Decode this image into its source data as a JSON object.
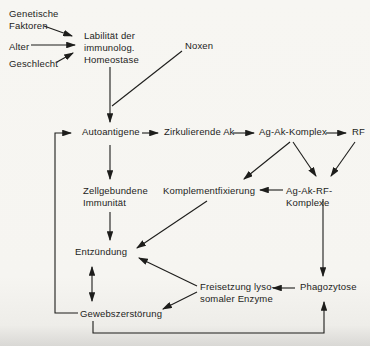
{
  "figure": {
    "language": "de",
    "type": "flowchart"
  },
  "colors": {
    "paper": "#f6f5f1",
    "ink": "#1d1d1b"
  },
  "nodes": {
    "genetische_faktoren": {
      "label": "Genetische\nFaktoren"
    },
    "alter": {
      "label": "Alter"
    },
    "geschlecht": {
      "label": "Geschlecht"
    },
    "labilitaet": {
      "label": "Labilität der\nimmunolog.\nHomeostase"
    },
    "noxen": {
      "label": "Noxen"
    },
    "autoantigene": {
      "label": "Autoantigene"
    },
    "zirkulierende_ak": {
      "label": "Zirkulierende Ak"
    },
    "ag_ak_komplex": {
      "label": "Ag-Ak-Komplex"
    },
    "rf": {
      "label": "RF"
    },
    "zellgebundene_immunitaet": {
      "label": "Zellgebundene\nImmunität"
    },
    "komplementfixierung": {
      "label": "Komplementfixierung"
    },
    "ag_ak_rf_komplexe": {
      "label": "Ag-Ak-RF-Komplexe"
    },
    "entzuendung": {
      "label": "Entzündung"
    },
    "freisetzung_lysosomaler_enzyme": {
      "label": "Freisetzung lyso-\nsomaler Enzyme"
    },
    "phagozytose": {
      "label": "Phagozytose"
    },
    "gewebszerstoerung": {
      "label": "Gewebszerstörung"
    }
  },
  "edges": [
    {
      "from": "genetische_faktoren",
      "to": "labilitaet"
    },
    {
      "from": "alter",
      "to": "labilitaet"
    },
    {
      "from": "geschlecht",
      "to": "labilitaet"
    },
    {
      "from": "noxen",
      "to": "autoantigene"
    },
    {
      "from": "labilitaet",
      "to": "autoantigene"
    },
    {
      "from": "autoantigene",
      "to": "zirkulierende_ak"
    },
    {
      "from": "zirkulierende_ak",
      "to": "ag_ak_komplex"
    },
    {
      "from": "ag_ak_komplex",
      "to": "rf"
    },
    {
      "from": "ag_ak_komplex",
      "to": "komplementfixierung"
    },
    {
      "from": "ag_ak_komplex",
      "to": "ag_ak_rf_komplexe"
    },
    {
      "from": "rf",
      "to": "ag_ak_rf_komplexe"
    },
    {
      "from": "ag_ak_rf_komplexe",
      "to": "komplementfixierung"
    },
    {
      "from": "autoantigene",
      "to": "zellgebundene_immunitaet"
    },
    {
      "from": "zellgebundene_immunitaet",
      "to": "entzuendung"
    },
    {
      "from": "komplementfixierung",
      "to": "entzuendung"
    },
    {
      "from": "ag_ak_rf_komplexe",
      "to": "phagozytose"
    },
    {
      "from": "phagozytose",
      "to": "freisetzung_lysosomaler_enzyme"
    },
    {
      "from": "freisetzung_lysosomaler_enzyme",
      "to": "entzuendung"
    },
    {
      "from": "freisetzung_lysosomaler_enzyme",
      "to": "gewebszerstoerung"
    },
    {
      "from": "entzuendung",
      "to": "gewebszerstoerung",
      "bidirectional": true
    },
    {
      "from": "gewebszerstoerung",
      "to": "autoantigene"
    },
    {
      "from": "gewebszerstoerung",
      "to": "phagozytose"
    }
  ]
}
